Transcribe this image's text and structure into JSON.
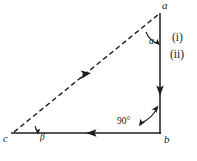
{
  "figure": {
    "background_color": "#ffffff",
    "line_color": "#1c1c1c",
    "vertices": {
      "a": {
        "label": "a",
        "x": 160,
        "y": 13,
        "role": "apex-top-right"
      },
      "b": {
        "label": "b",
        "x": 160,
        "y": 133,
        "role": "right-angle-bottom-right"
      },
      "c": {
        "label": "c",
        "x": 12,
        "y": 133,
        "role": "bottom-left"
      }
    },
    "vertex_labels": [
      {
        "name": "vertex-label-a",
        "text": "a",
        "x": 162,
        "y": 9
      },
      {
        "name": "vertex-label-b",
        "text": "b",
        "x": 164,
        "y": 143
      },
      {
        "name": "vertex-label-c",
        "text": "c",
        "x": 3,
        "y": 142
      }
    ],
    "angles": [
      {
        "name": "angle-alpha",
        "symbol": "α",
        "at_vertex": "a",
        "label_x": 151,
        "label_y": 42
      },
      {
        "name": "angle-beta",
        "symbol": "β",
        "at_vertex": "c",
        "label_x": 39,
        "label_y": 139
      },
      {
        "name": "angle-right",
        "symbol": "90°",
        "at_vertex": "b",
        "label_x": 118,
        "label_y": 124
      }
    ],
    "edges": [
      {
        "name": "edge-hypotenuse-c-to-a",
        "from": "c",
        "to": "a",
        "style": "dashed",
        "arrow": "midpoint-toward-a"
      },
      {
        "name": "edge-vertical-a-to-b",
        "from": "a",
        "to": "b",
        "style": "solid",
        "arrow": "midpoint-toward-b"
      },
      {
        "name": "edge-base-b-to-c",
        "from": "b",
        "to": "c",
        "style": "solid",
        "arrow": "midpoint-toward-c"
      }
    ],
    "notes": [
      {
        "name": "note-i",
        "text": "(i)",
        "x": 172,
        "y": 40
      },
      {
        "name": "note-ii",
        "text": "(ii)",
        "x": 170,
        "y": 57
      }
    ]
  }
}
